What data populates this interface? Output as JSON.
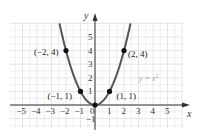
{
  "chart_data": {
    "type": "line",
    "title": "",
    "function": "y = x^2",
    "legend_label": "y = x²",
    "xlabel": "x",
    "ylabel": "y",
    "xlim": [
      -5,
      5
    ],
    "ylim": [
      -1,
      5
    ],
    "x_ticks": [
      "−5",
      "−4",
      "−3",
      "−2",
      "−1",
      "0",
      "1",
      "2",
      "3",
      "4",
      "5"
    ],
    "y_ticks": [
      "5",
      "4",
      "3",
      "2",
      "1",
      "−1"
    ],
    "grid": true,
    "points": [
      {
        "x": -2,
        "y": 4,
        "label": "(−2, 4)"
      },
      {
        "x": -1,
        "y": 1,
        "label": "(−1, 1)"
      },
      {
        "x": 0,
        "y": 0,
        "label": ""
      },
      {
        "x": 1,
        "y": 1,
        "label": "(1, 1)"
      },
      {
        "x": 2,
        "y": 4,
        "label": "(2, 4)"
      }
    ],
    "curve_color": "#555555",
    "point_color": "#111111",
    "grid_color": "#dde0e0"
  }
}
